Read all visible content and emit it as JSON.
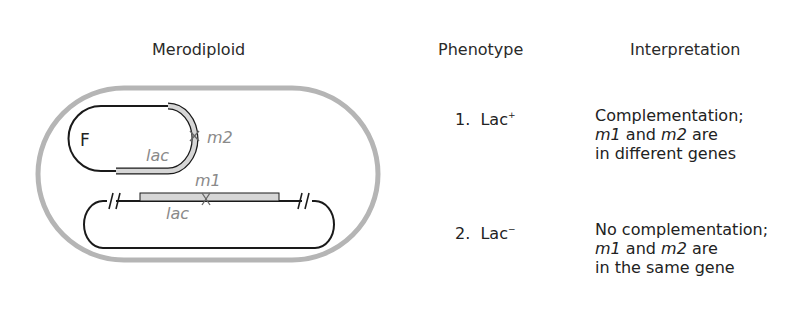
{
  "headers": {
    "merodiploid": "Merodiploid",
    "phenotype": "Phenotype",
    "interpretation": "Interpretation"
  },
  "diagram": {
    "f_label": "F",
    "f_lac_label": "lac",
    "f_mutation_label": "m2",
    "chrom_lac_label": "lac",
    "chrom_mutation_label": "m1",
    "colors": {
      "cell_wall": "#b5b5b5",
      "dna_line": "#1a1a1a",
      "lac_gene_fill": "#d6d6d6",
      "label_gray": "#8a8a8a"
    }
  },
  "rows": [
    {
      "number": "1.",
      "phenotype": "Lac",
      "phenotype_sup": "+",
      "interpretation_line1": "Complementation;",
      "m1": "m1",
      "and": " and ",
      "m2": "m2",
      "are": " are",
      "interpretation_line3": "in different genes"
    },
    {
      "number": "2.",
      "phenotype": "Lac",
      "phenotype_sup": "−",
      "interpretation_line1": "No complementation;",
      "m1": "m1",
      "and": " and ",
      "m2": "m2",
      "are": " are",
      "interpretation_line3": "in the same gene"
    }
  ]
}
